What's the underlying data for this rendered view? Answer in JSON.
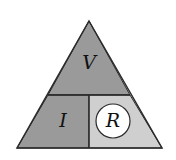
{
  "diagram": {
    "labels": {
      "top": "V",
      "bottom_left": "I",
      "bottom_right": "R"
    },
    "highlighted": "R",
    "colors": {
      "dark_fill": "#9a9a9a",
      "light_fill": "#cfcfcf",
      "stroke": "#2a2a2a",
      "circle_fill": "#ffffff"
    }
  }
}
